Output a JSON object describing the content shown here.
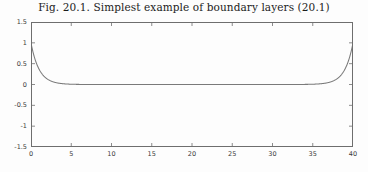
{
  "figure": {
    "title": "Fig. 20.1.  Simplest example of boundary layers (20.1)",
    "background_color": "#fdfdfd",
    "frame_color": "#6e6e6e",
    "curve_color": "#7a7a7a",
    "tick_label_color": "#3a3a3a"
  },
  "chart_data": {
    "type": "line",
    "title": "Fig. 20.1.  Simplest example of boundary layers (20.1)",
    "xlabel": "",
    "ylabel": "",
    "xlim": [
      0,
      40
    ],
    "ylim": [
      -1.5,
      1.5
    ],
    "grid": false,
    "legend": null,
    "xticks": [
      0,
      5,
      10,
      15,
      20,
      25,
      30,
      35,
      40
    ],
    "xtick_labels": [
      "0",
      "5",
      "10",
      "15",
      "20",
      "25",
      "30",
      "35",
      "40"
    ],
    "yticks": [
      1.5,
      1,
      0.5,
      0,
      -0.5,
      -1,
      -1.5
    ],
    "ytick_labels": [
      "1.5",
      "1",
      "0.5",
      "0",
      "-0.5",
      "-1",
      "-1.5"
    ],
    "series": [
      {
        "name": "u(x) = e^{-x} + e^{-(40-x)}",
        "x": [
          0,
          0.25,
          0.5,
          0.75,
          1,
          1.25,
          1.5,
          1.75,
          2,
          2.5,
          3,
          3.5,
          4,
          4.5,
          5,
          6,
          7,
          8,
          10,
          12,
          14,
          16,
          18,
          20,
          22,
          24,
          26,
          28,
          30,
          32,
          34,
          35,
          35.5,
          36,
          36.5,
          37,
          37.5,
          38,
          38.25,
          38.5,
          38.75,
          39,
          39.25,
          39.5,
          39.75,
          40
        ],
        "y": [
          1,
          0.779,
          0.607,
          0.472,
          0.368,
          0.287,
          0.223,
          0.174,
          0.135,
          0.082,
          0.05,
          0.03,
          0.018,
          0.011,
          0.0067,
          0.0025,
          0.0009,
          0.0003,
          0.0001,
          0.0001,
          0.0001,
          0.0001,
          0.0001,
          0.0001,
          0.0001,
          0.0001,
          0.0001,
          0.0003,
          0.0009,
          0.0025,
          0.0067,
          0.011,
          0.014,
          0.018,
          0.023,
          0.03,
          0.039,
          0.05,
          0.057,
          0.082,
          0.105,
          0.135,
          0.174,
          0.223,
          0.287,
          1
        ]
      }
    ]
  }
}
